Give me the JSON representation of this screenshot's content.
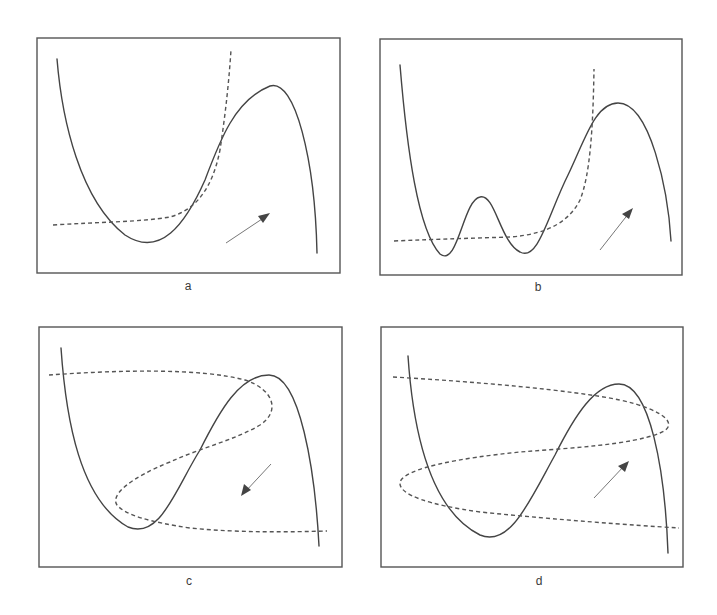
{
  "figure": {
    "panels": [
      {
        "id": "a",
        "label": "a",
        "arrow_direction": "up-right"
      },
      {
        "id": "b",
        "label": "b",
        "arrow_direction": "up-right"
      },
      {
        "id": "c",
        "label": "c",
        "arrow_direction": "down-left"
      },
      {
        "id": "d",
        "label": "d",
        "arrow_direction": "up-right"
      }
    ]
  },
  "colors": {
    "frame": "#555555",
    "solid_curve": "#444444",
    "dashed_curve": "#555555",
    "arrow": "#777777",
    "background": "#ffffff"
  }
}
